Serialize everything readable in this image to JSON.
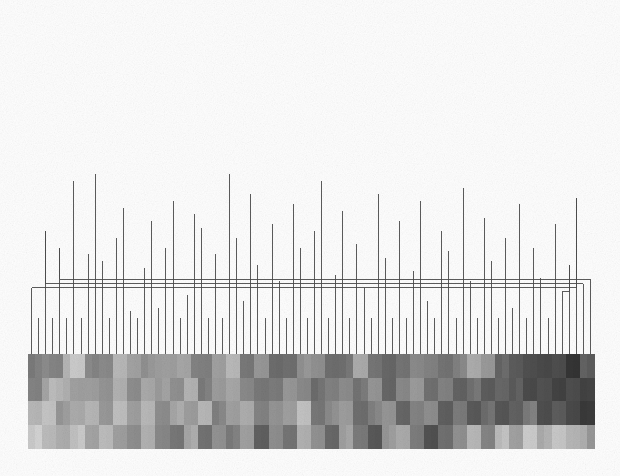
{
  "figure": {
    "type": "dendrogram-heatmap",
    "title": "",
    "background_color": "#fefefe",
    "line_color": "#4a4a4a",
    "line_width": 0.9
  },
  "chart_data": {
    "type": "heatmap",
    "title": "",
    "subtitle": "",
    "xlabel": "",
    "ylabel": "",
    "legend": [],
    "annotations": [],
    "grid": false,
    "colormap": "grayscale",
    "value_range": [
      0,
      1
    ],
    "n_leaves": 80,
    "n_rows": 4,
    "plot_area": {
      "x": 28,
      "y": 354,
      "width": 566,
      "height": 94
    },
    "dendrogram_area": {
      "x": 28,
      "y": 14,
      "width": 566,
      "height": 334
    },
    "leaf_tick_baseline_y": 354,
    "row_labels": [
      "",
      "",
      "",
      ""
    ],
    "column_labels": [],
    "dendrogram": {
      "orientation": "top",
      "root_height": 1.0,
      "merges": [
        {
          "id": 158,
          "left": 156,
          "right": 157,
          "height": 0.972
        },
        {
          "id": 157,
          "left": 150,
          "right": 155,
          "height": 0.934
        },
        {
          "id": 156,
          "left": 146,
          "right": 149,
          "height": 0.878
        },
        {
          "id": 155,
          "left": 148,
          "right": 154,
          "height": 0.866
        },
        {
          "id": 154,
          "left": 151,
          "right": 153,
          "height": 0.852
        },
        {
          "id": 153,
          "left": 147,
          "right": 152,
          "height": 0.8
        },
        {
          "id": 152,
          "left": 140,
          "right": 145,
          "height": 0.744
        },
        {
          "id": 151,
          "left": 138,
          "right": 144,
          "height": 0.741
        },
        {
          "id": 150,
          "left": 137,
          "right": 143,
          "height": 0.722
        },
        {
          "id": 149,
          "left": 136,
          "right": 142,
          "height": 0.7
        },
        {
          "id": 148,
          "left": 135,
          "right": 141,
          "height": 0.693
        },
        {
          "id": 147,
          "left": 133,
          "right": 139,
          "height": 0.659
        },
        {
          "id": 146,
          "left": 129,
          "right": 134,
          "height": 0.648
        },
        {
          "id": 145,
          "left": 128,
          "right": 132,
          "height": 0.604
        },
        {
          "id": 144,
          "left": 127,
          "right": 131,
          "height": 0.582
        },
        {
          "id": 143,
          "left": 124,
          "right": 130,
          "height": 0.563
        },
        {
          "id": 142,
          "left": 121,
          "right": 126,
          "height": 0.541
        },
        {
          "id": 141,
          "left": 120,
          "right": 125,
          "height": 0.525
        },
        {
          "id": 140,
          "left": 117,
          "right": 123,
          "height": 0.511
        },
        {
          "id": 139,
          "left": 116,
          "right": 122,
          "height": 0.498
        },
        {
          "id": 138,
          "left": 113,
          "right": 119,
          "height": 0.48
        },
        {
          "id": 137,
          "left": 111,
          "right": 118,
          "height": 0.463
        },
        {
          "id": 136,
          "left": 108,
          "right": 115,
          "height": 0.451
        },
        {
          "id": 135,
          "left": 106,
          "right": 114,
          "height": 0.432
        },
        {
          "id": 134,
          "left": 103,
          "right": 112,
          "height": 0.419
        },
        {
          "id": 133,
          "left": 101,
          "right": 110,
          "height": 0.403
        },
        {
          "id": 132,
          "left": 99,
          "right": 109,
          "height": 0.389
        },
        {
          "id": 131,
          "left": 97,
          "right": 107,
          "height": 0.377
        },
        {
          "id": 130,
          "left": 94,
          "right": 105,
          "height": 0.366
        },
        {
          "id": 129,
          "left": 92,
          "right": 104,
          "height": 0.354
        },
        {
          "id": 128,
          "left": 90,
          "right": 102,
          "height": 0.341
        },
        {
          "id": 127,
          "left": 88,
          "right": 100,
          "height": 0.329
        },
        {
          "id": 126,
          "left": 86,
          "right": 98,
          "height": 0.318
        },
        {
          "id": 125,
          "left": 84,
          "right": 96,
          "height": 0.305
        },
        {
          "id": 124,
          "left": 82,
          "right": 95,
          "height": 0.292
        },
        {
          "id": 123,
          "left": 81,
          "right": 93,
          "height": 0.281
        },
        {
          "id": 122,
          "left": 80,
          "right": 91,
          "height": 0.268
        },
        {
          "id": 121,
          "left": 12,
          "right": 89,
          "height": 0.256
        },
        {
          "id": 120,
          "left": 10,
          "right": 87,
          "height": 0.243
        },
        {
          "id": 119,
          "left": 8,
          "right": 85,
          "height": 0.231
        },
        {
          "id": 118,
          "left": 6,
          "right": 83,
          "height": 0.218
        },
        {
          "id": 117,
          "left": 4,
          "right": 79,
          "height": 0.206
        },
        {
          "id": 116,
          "left": 2,
          "right": 78,
          "height": 0.193
        },
        {
          "id": 115,
          "left": 0,
          "right": 77,
          "height": 0.181
        },
        {
          "id": 114,
          "left": 76,
          "right": 75,
          "height": 0.168
        }
      ]
    },
    "leaf_stems": [
      0.17,
      0.09,
      0.35,
      0.09,
      0.3,
      0.09,
      0.5,
      0.09,
      0.28,
      0.52,
      0.26,
      0.09,
      0.33,
      0.42,
      0.11,
      0.09,
      0.24,
      0.38,
      0.12,
      0.3,
      0.44,
      0.09,
      0.16,
      0.4,
      0.36,
      0.09,
      0.28,
      0.09,
      0.52,
      0.33,
      0.14,
      0.46,
      0.25,
      0.09,
      0.37,
      0.2,
      0.09,
      0.43,
      0.3,
      0.09,
      0.35,
      0.5,
      0.09,
      0.22,
      0.41,
      0.09,
      0.31,
      0.18,
      0.09,
      0.46,
      0.27,
      0.09,
      0.38,
      0.09,
      0.23,
      0.44,
      0.14,
      0.09,
      0.35,
      0.29,
      0.09,
      0.48,
      0.2,
      0.09,
      0.39,
      0.26,
      0.09,
      0.33,
      0.12,
      0.43,
      0.09,
      0.3,
      0.21,
      0.09,
      0.37,
      0.09,
      0.25,
      0.45,
      0.17,
      0.09
    ],
    "values": [
      [
        0.55,
        0.55,
        0.5,
        0.52,
        0.52,
        0.28,
        0.22,
        0.22,
        0.5,
        0.52,
        0.48,
        0.48,
        0.3,
        0.3,
        0.38,
        0.38,
        0.45,
        0.45,
        0.42,
        0.4,
        0.4,
        0.35,
        0.35,
        0.55,
        0.55,
        0.55,
        0.38,
        0.38,
        0.3,
        0.3,
        0.58,
        0.58,
        0.42,
        0.42,
        0.65,
        0.65,
        0.62,
        0.62,
        0.45,
        0.45,
        0.48,
        0.48,
        0.62,
        0.62,
        0.6,
        0.6,
        0.35,
        0.35,
        0.58,
        0.58,
        0.68,
        0.68,
        0.6,
        0.6,
        0.48,
        0.48,
        0.55,
        0.55,
        0.6,
        0.6,
        0.52,
        0.52,
        0.35,
        0.35,
        0.42,
        0.42,
        0.65,
        0.65,
        0.72,
        0.72,
        0.76,
        0.76,
        0.82,
        0.82,
        0.78,
        0.78,
        0.88,
        0.88,
        0.7,
        0.72
      ],
      [
        0.52,
        0.52,
        0.35,
        0.28,
        0.3,
        0.32,
        0.38,
        0.38,
        0.42,
        0.42,
        0.45,
        0.45,
        0.3,
        0.3,
        0.5,
        0.5,
        0.35,
        0.35,
        0.4,
        0.4,
        0.48,
        0.48,
        0.3,
        0.3,
        0.55,
        0.55,
        0.42,
        0.42,
        0.35,
        0.35,
        0.52,
        0.52,
        0.58,
        0.58,
        0.55,
        0.55,
        0.45,
        0.45,
        0.5,
        0.5,
        0.62,
        0.62,
        0.55,
        0.55,
        0.48,
        0.48,
        0.58,
        0.58,
        0.45,
        0.45,
        0.65,
        0.65,
        0.52,
        0.52,
        0.42,
        0.42,
        0.6,
        0.6,
        0.55,
        0.55,
        0.68,
        0.68,
        0.6,
        0.6,
        0.72,
        0.72,
        0.65,
        0.65,
        0.7,
        0.7,
        0.8,
        0.8,
        0.75,
        0.75,
        0.85,
        0.85,
        0.78,
        0.78,
        0.82,
        0.8
      ],
      [
        0.3,
        0.3,
        0.22,
        0.22,
        0.42,
        0.42,
        0.35,
        0.35,
        0.28,
        0.28,
        0.45,
        0.45,
        0.25,
        0.25,
        0.38,
        0.38,
        0.3,
        0.3,
        0.48,
        0.48,
        0.35,
        0.35,
        0.42,
        0.42,
        0.28,
        0.28,
        0.52,
        0.52,
        0.4,
        0.4,
        0.32,
        0.32,
        0.55,
        0.55,
        0.45,
        0.45,
        0.38,
        0.38,
        0.25,
        0.25,
        0.58,
        0.58,
        0.48,
        0.48,
        0.42,
        0.42,
        0.62,
        0.62,
        0.52,
        0.52,
        0.45,
        0.45,
        0.65,
        0.65,
        0.55,
        0.55,
        0.48,
        0.48,
        0.68,
        0.68,
        0.58,
        0.58,
        0.72,
        0.72,
        0.62,
        0.62,
        0.75,
        0.75,
        0.68,
        0.68,
        0.55,
        0.55,
        0.78,
        0.78,
        0.7,
        0.7,
        0.82,
        0.82,
        0.88,
        0.86
      ],
      [
        0.18,
        0.18,
        0.28,
        0.28,
        0.32,
        0.32,
        0.22,
        0.22,
        0.38,
        0.38,
        0.25,
        0.25,
        0.42,
        0.42,
        0.48,
        0.48,
        0.3,
        0.3,
        0.52,
        0.52,
        0.58,
        0.58,
        0.35,
        0.35,
        0.62,
        0.62,
        0.45,
        0.45,
        0.55,
        0.55,
        0.4,
        0.4,
        0.68,
        0.68,
        0.5,
        0.5,
        0.6,
        0.6,
        0.3,
        0.3,
        0.48,
        0.48,
        0.65,
        0.65,
        0.38,
        0.38,
        0.58,
        0.58,
        0.72,
        0.72,
        0.42,
        0.42,
        0.35,
        0.35,
        0.55,
        0.55,
        0.78,
        0.78,
        0.62,
        0.62,
        0.45,
        0.45,
        0.3,
        0.3,
        0.52,
        0.52,
        0.25,
        0.25,
        0.4,
        0.4,
        0.18,
        0.18,
        0.32,
        0.32,
        0.22,
        0.22,
        0.28,
        0.28,
        0.35,
        0.45
      ]
    ]
  }
}
